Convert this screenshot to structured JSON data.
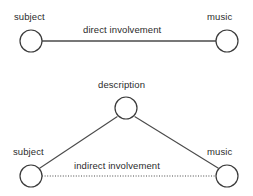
{
  "diagram": {
    "background_color": "#ffffff",
    "stroke_color": "#4a4a4a",
    "node_stroke_color": "#3a3a3a",
    "node_fill_color": "#ffffff",
    "text_color": "#2b2b2b",
    "graphs": [
      {
        "name": "direct-involvement-graph",
        "nodes": [
          {
            "id": "subject-top",
            "label": "subject",
            "cx": 31,
            "cy": 41,
            "r": 11
          },
          {
            "id": "music-top",
            "label": "music",
            "cx": 227,
            "cy": 41,
            "r": 11
          }
        ],
        "edges": [
          {
            "id": "direct-edge",
            "from": "subject-top",
            "to": "music-top",
            "label": "direct involvement",
            "style": "solid"
          }
        ]
      },
      {
        "name": "indirect-involvement-graph",
        "nodes": [
          {
            "id": "description",
            "label": "description",
            "cx": 126,
            "cy": 108,
            "r": 11
          },
          {
            "id": "subject-bottom",
            "label": "subject",
            "cx": 31,
            "cy": 176,
            "r": 11
          },
          {
            "id": "music-bottom",
            "label": "music",
            "cx": 227,
            "cy": 176,
            "r": 11
          }
        ],
        "edges": [
          {
            "id": "subject-description-edge",
            "from": "subject-bottom",
            "to": "description",
            "label": "",
            "style": "solid"
          },
          {
            "id": "description-music-edge",
            "from": "description",
            "to": "music-bottom",
            "label": "",
            "style": "solid"
          },
          {
            "id": "indirect-edge",
            "from": "subject-bottom",
            "to": "music-bottom",
            "label": "indirect involvement",
            "style": "dotted"
          }
        ]
      }
    ]
  }
}
